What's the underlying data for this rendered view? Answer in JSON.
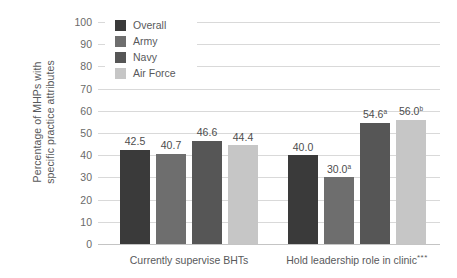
{
  "chart_data": {
    "type": "bar",
    "title": "",
    "xlabel": "",
    "ylabel": "Percentage of MHPs with specific practice attributes",
    "ylabel_line1": "Percentage of MHPs with",
    "ylabel_line2": "specific practice attributes",
    "ylim": [
      0,
      100
    ],
    "ytick_step": 10,
    "yticks": [
      "100",
      "90",
      "80",
      "70",
      "60",
      "50",
      "40",
      "30",
      "20",
      "10",
      "0"
    ],
    "grid": true,
    "legend_position": "top-left-inside",
    "categories": [
      "Currently supervise BHTs",
      "Hold leadership role in clinic"
    ],
    "category_suffixes": [
      "",
      "***"
    ],
    "series": [
      {
        "name": "Overall",
        "color": "#3a3a3a",
        "values": [
          42.5,
          40.0
        ],
        "labels": [
          "42.5",
          "40.0"
        ],
        "superscripts": [
          "",
          ""
        ]
      },
      {
        "name": "Army",
        "color": "#6e6e6e",
        "values": [
          40.7,
          30.0
        ],
        "labels": [
          "40.7",
          "30.0"
        ],
        "superscripts": [
          "",
          "a"
        ]
      },
      {
        "name": "Navy",
        "color": "#565656",
        "values": [
          46.6,
          54.6
        ],
        "labels": [
          "46.6",
          "54.6"
        ],
        "superscripts": [
          "",
          "a"
        ]
      },
      {
        "name": "Air Force",
        "color": "#c6c6c6",
        "values": [
          44.4,
          56.0
        ],
        "labels": [
          "44.4",
          "56.0"
        ],
        "superscripts": [
          "",
          "b"
        ]
      }
    ]
  },
  "legend": {
    "items": [
      {
        "label": "Overall",
        "color": "#3a3a3a"
      },
      {
        "label": "Army",
        "color": "#6e6e6e"
      },
      {
        "label": "Navy",
        "color": "#565656"
      },
      {
        "label": "Air Force",
        "color": "#c6c6c6"
      }
    ]
  }
}
